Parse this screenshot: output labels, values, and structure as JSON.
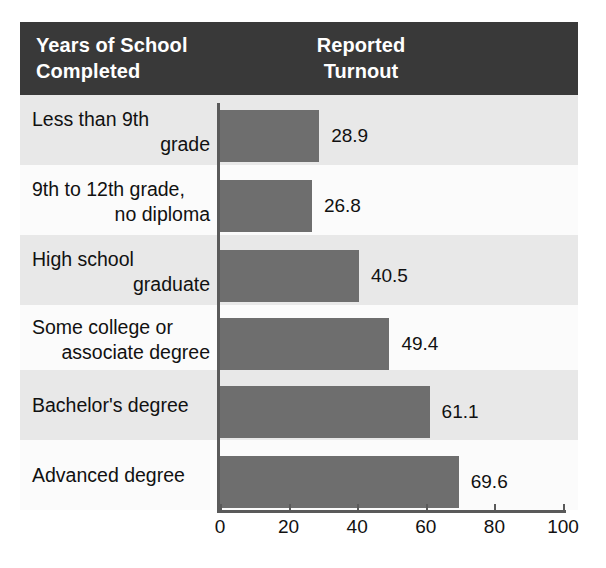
{
  "header": {
    "left_title_line1": "Years of School",
    "left_title_line2": "Completed",
    "right_title_line1": "Reported",
    "right_title_line2": "Turnout",
    "background_color": "#393939",
    "text_color": "#ffffff"
  },
  "colors": {
    "bar": "#6e6e6e",
    "band_shade": "#e8e8e8",
    "band_plain": "#fbfbfb",
    "axis": "#5a5a5a",
    "text": "#111111"
  },
  "chart_data": {
    "type": "bar",
    "orientation": "horizontal",
    "title": "Reported Turnout",
    "xlabel": "",
    "ylabel": "Years of School Completed",
    "xlim": [
      0,
      100
    ],
    "grid": false,
    "legend": null,
    "xticks": [
      0,
      20,
      40,
      60,
      80,
      100
    ],
    "xticklabels": [
      "0",
      "20",
      "40",
      "60",
      "80",
      "100"
    ],
    "categories": [
      "Less than 9th grade",
      "9th to 12th grade, no diploma",
      "High school graduate",
      "Some college or associate degree",
      "Bachelor's degree",
      "Advanced degree"
    ],
    "category_lines": [
      [
        "Less than 9th",
        "grade"
      ],
      [
        "9th to 12th grade,",
        "no diploma"
      ],
      [
        "High school",
        "graduate"
      ],
      [
        "Some college or",
        "associate degree"
      ],
      [
        "Bachelor's degree",
        ""
      ],
      [
        "Advanced degree",
        ""
      ]
    ],
    "values": [
      28.9,
      26.8,
      40.5,
      49.4,
      61.1,
      69.6
    ],
    "value_labels": [
      "28.9",
      "26.8",
      "40.5",
      "49.4",
      "61.1",
      "69.6"
    ]
  }
}
